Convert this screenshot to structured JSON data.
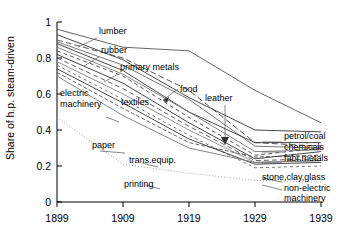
{
  "chart_data": {
    "type": "line",
    "title": "",
    "xlabel": "",
    "ylabel": "Share of h.p. steam-driven",
    "x": [
      1899,
      1909,
      1919,
      1929,
      1939
    ],
    "xticklabels": [
      "1899",
      "1909",
      "1919",
      "1929",
      "1939"
    ],
    "yticklabels": [
      "0",
      "0.2",
      "0.4",
      "0.6",
      "0.8",
      "1"
    ],
    "yticks": [
      0,
      0.2,
      0.4,
      0.6,
      0.8,
      1
    ],
    "xlim": [
      1899,
      1939
    ],
    "ylim": [
      0,
      1
    ],
    "grid": false,
    "legend": "inline-labels",
    "series": [
      {
        "name": "lumber",
        "values": [
          0.96,
          0.86,
          0.84,
          0.62,
          0.44
        ]
      },
      {
        "name": "leather",
        "values": [
          0.93,
          0.79,
          0.58,
          0.4,
          0.39
        ]
      },
      {
        "name": "rubber",
        "values": [
          0.9,
          0.8,
          0.62,
          0.33,
          0.31
        ]
      },
      {
        "name": "primary metals",
        "values": [
          0.89,
          0.76,
          0.57,
          0.31,
          0.3
        ]
      },
      {
        "name": "petrol/coal",
        "values": [
          0.88,
          0.73,
          0.5,
          0.33,
          0.33
        ]
      },
      {
        "name": "food",
        "values": [
          0.86,
          0.71,
          0.5,
          0.28,
          0.29
        ]
      },
      {
        "name": "chemicals",
        "values": [
          0.84,
          0.7,
          0.47,
          0.26,
          0.3
        ]
      },
      {
        "name": "fabr.metals",
        "values": [
          0.82,
          0.66,
          0.44,
          0.24,
          0.28
        ]
      },
      {
        "name": "textiles",
        "values": [
          0.8,
          0.63,
          0.42,
          0.23,
          0.24
        ]
      },
      {
        "name": "stone,clay,glass",
        "values": [
          0.78,
          0.6,
          0.4,
          0.22,
          0.23
        ]
      },
      {
        "name": "non-electric machinery",
        "values": [
          0.76,
          0.57,
          0.37,
          0.19,
          0.2
        ]
      },
      {
        "name": "trans.equip.",
        "values": [
          0.74,
          0.55,
          0.35,
          0.21,
          0.22
        ]
      },
      {
        "name": "paper",
        "values": [
          0.72,
          0.52,
          0.33,
          0.25,
          0.26
        ]
      },
      {
        "name": "electric machinery",
        "values": [
          0.7,
          0.48,
          0.3,
          0.22,
          0.23
        ]
      },
      {
        "name": "printing",
        "values": [
          0.47,
          0.21,
          0.16,
          0.12,
          0.11
        ]
      }
    ],
    "annotations": [
      {
        "text": "lumber",
        "kind": "inline"
      },
      {
        "text": "rubber",
        "kind": "inline"
      },
      {
        "text": "primary metals",
        "kind": "inline"
      },
      {
        "text": "food",
        "kind": "leader-arrow"
      },
      {
        "text": "leather",
        "kind": "leader-arrow"
      },
      {
        "text": "electric machinery",
        "kind": "inline"
      },
      {
        "text": "textiles",
        "kind": "inline"
      },
      {
        "text": "paper",
        "kind": "inline"
      },
      {
        "text": "trans.equip.",
        "kind": "inline"
      },
      {
        "text": "printing",
        "kind": "inline"
      },
      {
        "text": "petrol/coal",
        "kind": "right-callout"
      },
      {
        "text": "chemicals",
        "kind": "right-callout"
      },
      {
        "text": "fabr.metals",
        "kind": "right-callout"
      },
      {
        "text": "stone,clay,glass",
        "kind": "right-callout"
      },
      {
        "text": "non-electric",
        "kind": "right-callout"
      },
      {
        "text": "machinery",
        "kind": "right-callout"
      }
    ]
  },
  "axis": {
    "ylabel": "Share of h.p. steam-driven",
    "yticks": [
      "1",
      "0.8",
      "0.6",
      "0.4",
      "0.2",
      "0"
    ],
    "xticks": [
      "1899",
      "1909",
      "1919",
      "1929",
      "1939"
    ]
  },
  "labels": {
    "lumber": "lumber",
    "rubber": "rubber",
    "primary_metals": "primary metals",
    "food": "food",
    "leather": "leather",
    "electric": "electric",
    "machinery": "machinery",
    "textiles": "textiles",
    "paper": "paper",
    "trans_equip": "trans.equip.",
    "printing": "printing",
    "petrol_coal": "petrol/coal",
    "chemicals": "chemicals",
    "fabr_metals": "fabr.metals",
    "stone_clay_glass": "stone,clay,glass",
    "non_electric": "non-electric",
    "machinery2": "machinery"
  }
}
